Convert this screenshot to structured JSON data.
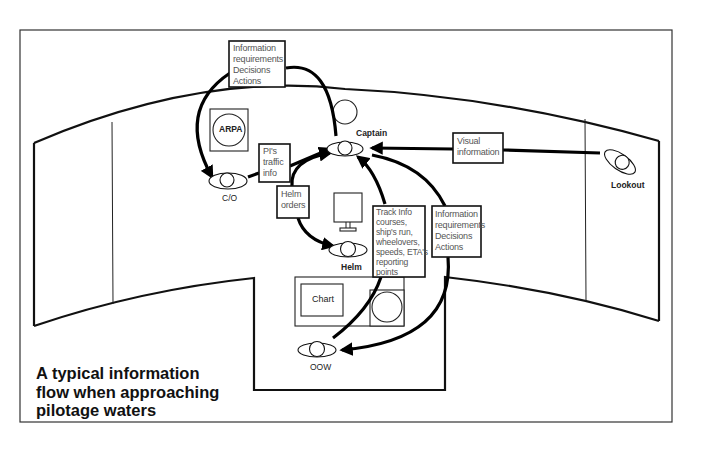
{
  "diagram": {
    "caption": {
      "lines": [
        "A typical information",
        "flow when approaching",
        "pilotage waters"
      ]
    },
    "roles": {
      "captain": "Captain",
      "co": "C/O",
      "helm": "Helm",
      "oow": "OOW",
      "lookout": "Lookout"
    },
    "equipment": {
      "arpa": "ARPA",
      "chart": "Chart"
    },
    "boxes": {
      "info_top": [
        "Information",
        "requirements",
        "Decisions",
        "Actions"
      ],
      "pi_traffic": [
        "PI's",
        "traffic",
        "info"
      ],
      "helm_orders": [
        "Helm",
        "orders"
      ],
      "visual": [
        "Visual",
        "information"
      ],
      "track_info": [
        "Track Info",
        "courses,",
        "ship's run,",
        "wheelovers,",
        "speeds, ETA's",
        "reporting",
        "points"
      ],
      "info_right": [
        "Information",
        "requirements",
        "Decisions",
        "Actions"
      ]
    },
    "flows": [
      {
        "from": "Captain",
        "to": "C/O",
        "via": "Information requirements / Decisions / Actions"
      },
      {
        "from": "C/O",
        "to": "Captain",
        "via": "PI's traffic info"
      },
      {
        "from": "Captain",
        "to": "Helm",
        "via": "Helm orders"
      },
      {
        "from": "Lookout",
        "to": "Captain",
        "via": "Visual information"
      },
      {
        "from": "OOW",
        "to": "Captain",
        "via": "Track Info"
      },
      {
        "from": "Captain",
        "to": "OOW",
        "via": "Information requirements / Decisions / Actions"
      }
    ]
  }
}
